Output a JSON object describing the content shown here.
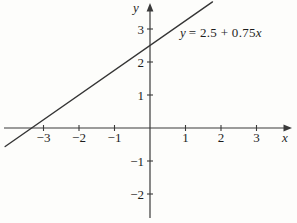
{
  "figure": {
    "axis_label_x": "x",
    "axis_label_y": "y",
    "equation": {
      "var_y": "y",
      "middle": "= 2.5 + 0.75",
      "var_x": "x"
    }
  },
  "chart_data": {
    "type": "line",
    "title": "",
    "equation_label": "y = 2.5 + 0.75x",
    "slope": 0.75,
    "intercept": 2.5,
    "y_intercept": 2.5,
    "x_intercept": -3.33,
    "xlabel": "x",
    "ylabel": "y",
    "xlim": [
      -4.2,
      4.05
    ],
    "ylim": [
      -2.85,
      3.95
    ],
    "x_ticks": [
      {
        "value": -3,
        "label": "−3"
      },
      {
        "value": -2,
        "label": "−2"
      },
      {
        "value": -1,
        "label": "−1"
      },
      {
        "value": 1,
        "label": "1"
      },
      {
        "value": 2,
        "label": "2"
      },
      {
        "value": 3,
        "label": "3"
      }
    ],
    "y_ticks": [
      {
        "value": 3,
        "label": "3"
      },
      {
        "value": 2,
        "label": "2"
      },
      {
        "value": 1,
        "label": "1"
      },
      {
        "value": -1,
        "label": "−1"
      },
      {
        "value": -2,
        "label": "−2"
      }
    ],
    "x_range_drawn": [
      -4.08,
      1.76
    ],
    "grid": false,
    "legend": false,
    "axis_color": "#3a3a3a",
    "line_color": "#353535",
    "text_color": "#1d1d1d",
    "background": "#fdfdfb"
  }
}
